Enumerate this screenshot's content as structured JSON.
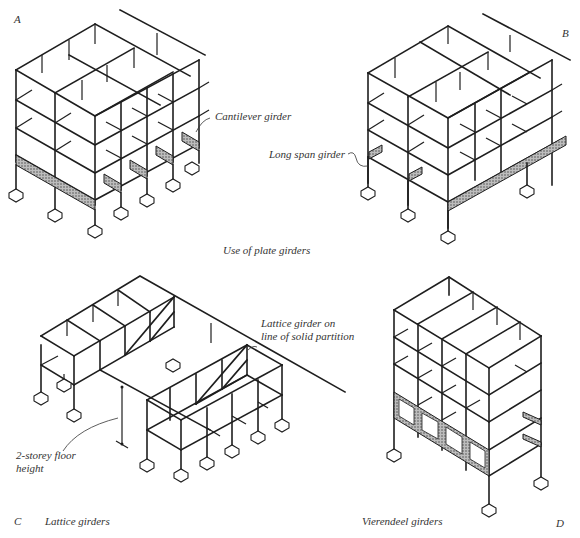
{
  "figure": {
    "caption_main": "Use of plate girders",
    "panels": [
      {
        "id": "A",
        "corner_label": "A",
        "annotation": "Cantilever girder"
      },
      {
        "id": "B",
        "corner_label": "B",
        "annotation": "Long span girder"
      },
      {
        "id": "C",
        "corner_label": "C",
        "caption": "Lattice girders",
        "annotations": [
          "Lattice girder on line of solid partition",
          "2-storey floor height"
        ],
        "annotation_lines": {
          "lattice_1": "Lattice girder on",
          "lattice_2": "line of solid partition",
          "height_1": "2-storey floor",
          "height_2": "height"
        }
      },
      {
        "id": "D",
        "corner_label": "D",
        "caption": "Vierendeel girders"
      }
    ]
  }
}
